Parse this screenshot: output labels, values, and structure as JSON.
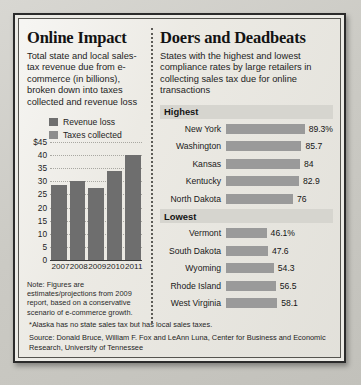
{
  "left_panel": {
    "title": "Online Impact",
    "description": "Total state and local sales-tax revenue due from e-commerce (in billions), broken down into taxes collected and revenue loss",
    "note": "Note: Figures are estimates/projections from 2009 report, based on a conservative scenario of e-commerce growth."
  },
  "right_panel": {
    "title": "Doers and Deadbeats",
    "description": "States with the highest and lowest compliance rates by large retailers in collecting sales tax due for online transactions",
    "highest_label": "Highest",
    "lowest_label": "Lowest"
  },
  "footer": {
    "footnote": "*Alaska has no state sales tax but has local sales taxes.",
    "source": "Source: Donald Bruce, William F. Fox and LeAnn Luna, Center for Business and Economic Research, University of Tennessee"
  },
  "chart_data": [
    {
      "type": "bar",
      "title": "Online Impact",
      "xlabel": "",
      "ylabel": "",
      "categories": [
        "2007",
        "2008",
        "2009",
        "2010",
        "2011"
      ],
      "values": [
        28.5,
        30.2,
        27.4,
        34.0,
        40.0
      ],
      "series": [
        {
          "name": "Revenue loss",
          "values": [
            28.5,
            30.2,
            27.4,
            34.0,
            40.0
          ]
        }
      ],
      "legend": [
        "Revenue loss",
        "Taxes collected"
      ],
      "legend_position": "top-left",
      "ylim": [
        0,
        45
      ],
      "yticks": [
        "$45",
        "40",
        "35",
        "30",
        "25",
        "20",
        "15",
        "10",
        "5",
        "0"
      ],
      "ytick_values": [
        45,
        40,
        35,
        30,
        25,
        20,
        15,
        10,
        5,
        0
      ],
      "grid": true,
      "units": "billions of dollars"
    },
    {
      "type": "bar",
      "title": "Highest",
      "orientation": "horizontal",
      "categories": [
        "New York",
        "Washington",
        "Kansas",
        "Kentucky",
        "North Dakota"
      ],
      "values": [
        89.3,
        85.7,
        84,
        82.9,
        76
      ],
      "value_labels": [
        "89.3%",
        "85.7",
        "84",
        "82.9",
        "76"
      ],
      "xlim": [
        0,
        100
      ],
      "grid": false,
      "units": "percent compliance"
    },
    {
      "type": "bar",
      "title": "Lowest",
      "orientation": "horizontal",
      "categories": [
        "Vermont",
        "South Dakota",
        "Wyoming",
        "Rhode Island",
        "West Virginia"
      ],
      "values": [
        46.1,
        47.6,
        54.3,
        56.5,
        58.1
      ],
      "value_labels": [
        "46.1%",
        "47.6",
        "54.3",
        "56.5",
        "58.1"
      ],
      "xlim": [
        0,
        100
      ],
      "grid": false,
      "units": "percent compliance"
    }
  ],
  "colors": {
    "revenue_loss": "#6e6e6e",
    "taxes_collected": "#8d8d8d",
    "rank_bar": "#9a9a9a",
    "paper": "#eceae4",
    "frame": "#2b2b2b"
  }
}
